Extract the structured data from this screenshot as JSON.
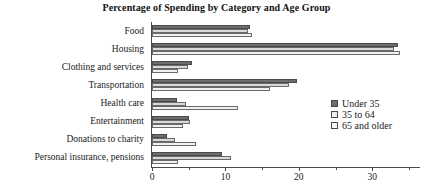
{
  "chart_data": {
    "type": "bar",
    "orientation": "horizontal",
    "title": "Percentage of Spending by Category and Age Group",
    "xlabel": "",
    "ylabel": "",
    "xlim": [
      0,
      36.5
    ],
    "xticks": [
      0,
      10,
      20,
      30
    ],
    "xtick_labels": [
      "0",
      "10",
      "20",
      "30"
    ],
    "minor_xticks": [
      5,
      15,
      25,
      35
    ],
    "grid": false,
    "legend_position": "right",
    "categories": [
      "Food",
      "Housing",
      "Clothing and services",
      "Transportation",
      "Health care",
      "Entertainment",
      "Donations to charity",
      "Personal insurance, pensions"
    ],
    "series": [
      {
        "name": "Under 35",
        "color": "#6e6e6e",
        "values": [
          13.4,
          33.5,
          5.5,
          19.8,
          3.4,
          5.1,
          2.0,
          9.6
        ]
      },
      {
        "name": "35 to 64",
        "color": "#d9d9d9",
        "values": [
          13.1,
          32.9,
          4.9,
          18.6,
          4.6,
          5.2,
          3.1,
          10.7
        ]
      },
      {
        "name": "65 and older",
        "color": "#f1f1f1",
        "values": [
          13.6,
          33.8,
          3.5,
          16.1,
          11.7,
          4.2,
          6.0,
          3.5
        ]
      }
    ]
  },
  "legend": {
    "items": [
      {
        "label": "Under 35"
      },
      {
        "label": "35 to 64"
      },
      {
        "label": "65 and older"
      }
    ]
  }
}
